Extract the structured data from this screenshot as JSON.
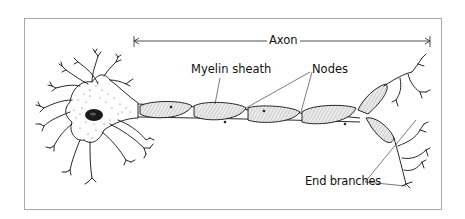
{
  "diagram": {
    "labels": {
      "axon": "Axon",
      "myelin_sheath": "Myelin sheath",
      "nodes": "Nodes",
      "end_branches": "End branches"
    },
    "colors": {
      "line": "#111111",
      "frame": "#a8a8a8",
      "stipple": "#333333",
      "nucleus": "#1a1a1a",
      "myelin_fill": "#d8d8d8"
    }
  }
}
